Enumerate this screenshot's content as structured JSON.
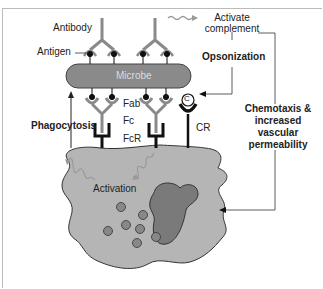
{
  "diagram": {
    "labels": {
      "antibody": "Antibody",
      "antigen": "Antigen",
      "microbe": "Microbe",
      "fab": "Fab",
      "fc": "Fc",
      "fcr": "FcR",
      "complement_symbol": "C",
      "cr": "CR",
      "activate_complement_line1": "Activate",
      "activate_complement_line2": "complement",
      "opsonization": "Opsonization",
      "phagocytosis": "Phagocytosis",
      "chemotaxis_line1": "Chemotaxis &",
      "chemotaxis_line2": "increased",
      "chemotaxis_line3": "vascular",
      "chemotaxis_line4": "permeability",
      "activation": "Activation"
    },
    "colors": {
      "microbe_fill": "#8a8a8a",
      "cell_fill": "#b5b5b5",
      "nucleus_fill": "#7a7a7a",
      "granule_fill": "#888888",
      "antibody_stroke": "#8a8a8a",
      "receptor_stroke": "#111111",
      "arrow_stroke": "#333333"
    }
  }
}
